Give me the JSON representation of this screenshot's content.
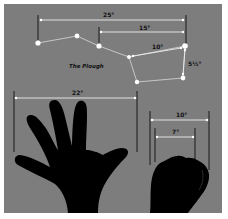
{
  "diagram": {
    "title": "The Plough",
    "colors": {
      "background": "#7d7d7d",
      "stars": "#ffffff",
      "lines": "#e8e8e8",
      "silhouette": "#000000",
      "tick": "#1a1a1a"
    },
    "measurements": {
      "plough_span": "25°",
      "pointer_to_end": "15°",
      "bowl_top": "10°",
      "pointers": "5½°",
      "hand_span": "22°",
      "fist_outer": "10°",
      "fist_inner": "7°"
    },
    "stars": [
      {
        "name": "alkaid",
        "x": 38,
        "y": 43
      },
      {
        "name": "mizar",
        "x": 77,
        "y": 36
      },
      {
        "name": "alioth",
        "x": 99,
        "y": 46
      },
      {
        "name": "megrez",
        "x": 129,
        "y": 57
      },
      {
        "name": "phecda",
        "x": 137,
        "y": 82
      },
      {
        "name": "merak",
        "x": 183,
        "y": 78
      },
      {
        "name": "dubhe",
        "x": 185,
        "y": 46
      }
    ]
  }
}
